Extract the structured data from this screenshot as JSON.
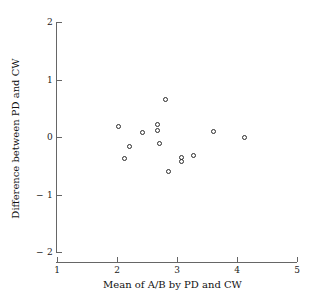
{
  "chart_data": {
    "type": "scatter",
    "title": "",
    "xlabel": "Mean of A/B by PD and CW",
    "ylabel": "Difference between PD and CW",
    "xlim": [
      1,
      5
    ],
    "ylim": [
      -2,
      2
    ],
    "xticks": [
      1,
      2,
      3,
      4,
      5
    ],
    "yticks": [
      2,
      1,
      0,
      -1,
      -2
    ],
    "xtick_labels": [
      "1",
      "2",
      "3",
      "4",
      "5"
    ],
    "ytick_labels": [
      "2",
      "1",
      "0",
      "− 1",
      "− 2"
    ],
    "grid": false,
    "legend": null,
    "marker": "open-circle",
    "marker_color": "#2b2b2b",
    "points": [
      {
        "x": 2.02,
        "y": 0.19
      },
      {
        "x": 2.2,
        "y": -0.16
      },
      {
        "x": 2.12,
        "y": -0.37
      },
      {
        "x": 2.43,
        "y": 0.07
      },
      {
        "x": 2.67,
        "y": 0.22
      },
      {
        "x": 2.67,
        "y": 0.12
      },
      {
        "x": 2.7,
        "y": -0.12
      },
      {
        "x": 2.8,
        "y": 0.65
      },
      {
        "x": 2.85,
        "y": -0.6
      },
      {
        "x": 3.08,
        "y": -0.36
      },
      {
        "x": 3.08,
        "y": -0.43
      },
      {
        "x": 3.28,
        "y": -0.33
      },
      {
        "x": 3.6,
        "y": 0.09
      },
      {
        "x": 4.12,
        "y": 0.0
      }
    ]
  },
  "axes": {
    "x_title": "Mean of A/B by PD and CW",
    "y_title": "Difference between PD and CW"
  }
}
